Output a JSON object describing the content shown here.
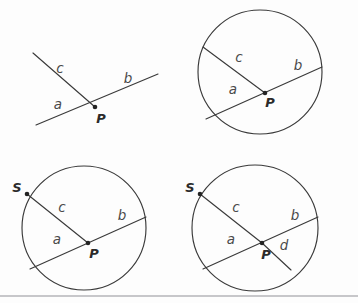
{
  "page": {
    "background_color": "#fdfdfd",
    "width": 358,
    "height": 303,
    "stroke_color": "#3a3a3a",
    "label_color": "#4a4a4a",
    "point_color": "#232323",
    "divider_color": "#b4b4b8"
  },
  "figure": {
    "caption": "Four-stage geometric construction of an angle and chords in a circle",
    "panels": [
      {
        "id": "panel-angle",
        "name": "open-angle-at-p",
        "description": "Two rays meeting at point P, no circle",
        "labels": {
          "ray_c": "c",
          "ray_b": "b",
          "ray_a": "a",
          "point_p": "P"
        }
      },
      {
        "id": "panel-circle-chords",
        "name": "circle-with-two-chords",
        "description": "Circle with chords through interior point P",
        "labels": {
          "ray_c": "c",
          "ray_b": "b",
          "ray_a": "a",
          "point_p": "P"
        }
      },
      {
        "id": "panel-circle-labeled-s",
        "name": "circle-with-point-s",
        "description": "Circle with chords and labeled endpoint S",
        "labels": {
          "ray_c": "c",
          "ray_b": "b",
          "ray_a": "a",
          "point_p": "P",
          "point_s": "S"
        }
      },
      {
        "id": "panel-circle-four-segments",
        "name": "circle-with-segment-d",
        "description": "Circle with chords, point S, and additional segment d",
        "labels": {
          "ray_c": "c",
          "ray_b": "b",
          "ray_a": "a",
          "ray_d": "d",
          "point_p": "P",
          "point_s": "S"
        }
      }
    ]
  },
  "geometry": {
    "panel1": {
      "p": [
        95,
        107
      ],
      "c_end": [
        33,
        53
      ],
      "b_end": [
        158,
        74
      ],
      "a_end": [
        36,
        125
      ],
      "label_c": [
        60,
        69
      ],
      "label_b": [
        128,
        79
      ],
      "label_a": [
        58,
        105
      ],
      "label_p": [
        101,
        119
      ]
    },
    "panel2": {
      "center": [
        260,
        72
      ],
      "radius": 62,
      "p": [
        265,
        93
      ],
      "c_end": [
        203,
        47
      ],
      "b_end": [
        322,
        67
      ],
      "a_end": [
        206,
        119
      ],
      "label_c": [
        239,
        58
      ],
      "label_b": [
        298,
        66
      ],
      "label_a": [
        233,
        90
      ],
      "label_p": [
        270,
        103
      ]
    },
    "panel3": {
      "center": [
        84,
        228
      ],
      "radius": 62,
      "p": [
        88,
        243
      ],
      "s": [
        27,
        194
      ],
      "b_end": [
        146,
        217
      ],
      "a_end": [
        30,
        269
      ],
      "label_c": [
        62,
        208
      ],
      "label_b": [
        122,
        216
      ],
      "label_a": [
        57,
        240
      ],
      "label_p": [
        94,
        254
      ],
      "label_s": [
        17,
        188
      ]
    },
    "panel4": {
      "center": [
        255,
        228
      ],
      "radius": 63,
      "p": [
        262,
        243
      ],
      "s": [
        200,
        194
      ],
      "b_end": [
        318,
        217
      ],
      "a_end": [
        203,
        269
      ],
      "d_end": [
        291,
        270
      ],
      "label_c": [
        236,
        208
      ],
      "label_b": [
        295,
        216
      ],
      "label_a": [
        231,
        240
      ],
      "label_d": [
        284,
        246
      ],
      "label_p": [
        266,
        255
      ],
      "label_s": [
        190,
        188
      ]
    },
    "divider": {
      "x1": 0,
      "y1": 296,
      "x2": 358,
      "y2": 296
    }
  }
}
